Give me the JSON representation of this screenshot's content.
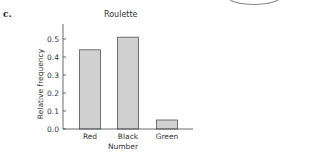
{
  "panel_label": "c.",
  "chart_data": {
    "type": "bar",
    "title": "Roulette",
    "xlabel": "Number",
    "ylabel": "Relative frequency",
    "categories": [
      "Red",
      "Black",
      "Green"
    ],
    "values": [
      0.44,
      0.51,
      0.05
    ],
    "ylim": [
      0.0,
      0.58
    ],
    "yticks": [
      0.0,
      0.1,
      0.2,
      0.3,
      0.4,
      0.5
    ],
    "ytick_labels": [
      "0.0",
      "0.1",
      "0.2",
      "0.3",
      "0.4",
      "0.5"
    ],
    "grid": false,
    "legend": null,
    "bar_color": "#d0d0d0",
    "bar_edge_color": "#555555"
  }
}
